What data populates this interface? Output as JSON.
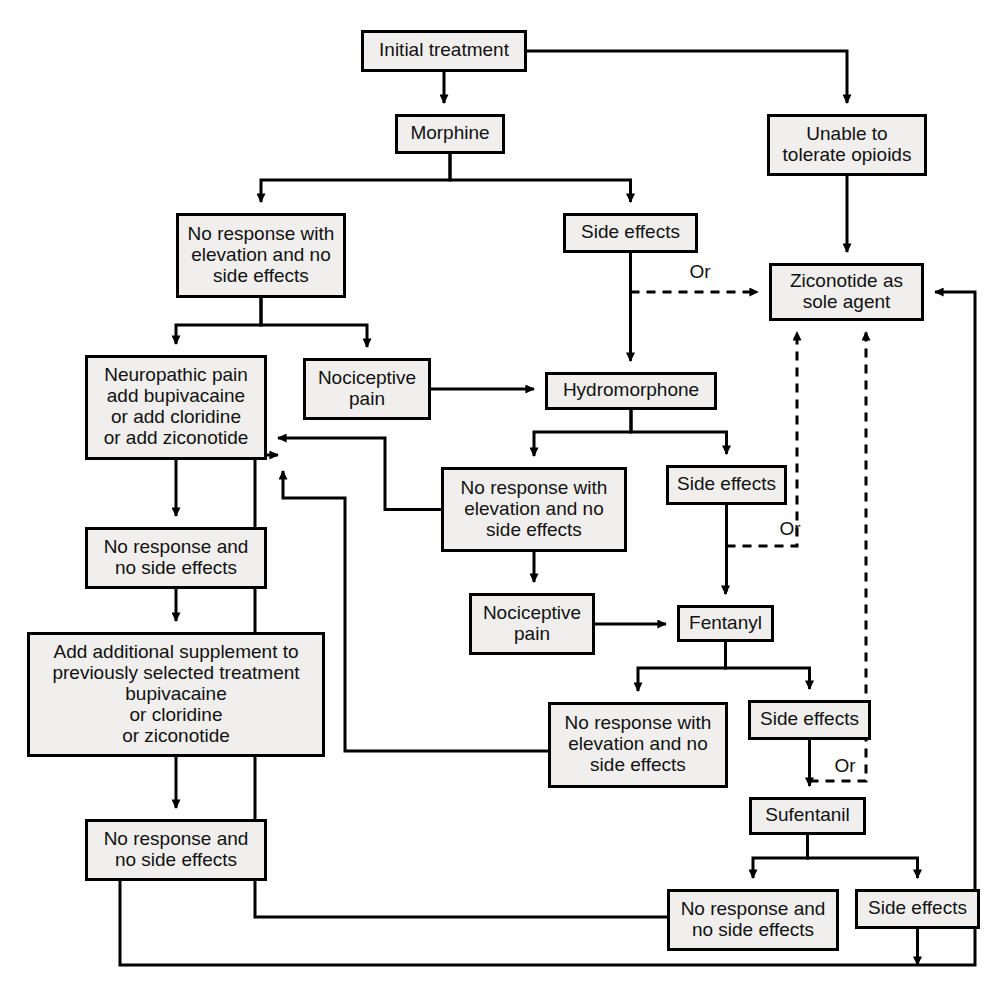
{
  "diagram": {
    "background_color": "#ffffff",
    "node_fill_color": "#f0efed",
    "stroke_color": "#000000",
    "nodes": [
      {
        "id": "initial",
        "label": "Initial treatment",
        "x": 361,
        "y": 30,
        "w": 166,
        "h": 42
      },
      {
        "id": "morphine",
        "label": "Morphine",
        "x": 395,
        "y": 114,
        "w": 110,
        "h": 40
      },
      {
        "id": "unable",
        "label": "Unable to|tolerate opioids",
        "x": 767,
        "y": 114,
        "w": 160,
        "h": 62
      },
      {
        "id": "m_noresp",
        "label": "No response with|elevation and no|side effects",
        "x": 176,
        "y": 213,
        "w": 170,
        "h": 85
      },
      {
        "id": "m_side",
        "label": "Side effects",
        "x": 563,
        "y": 213,
        "w": 135,
        "h": 40
      },
      {
        "id": "zico",
        "label": "Ziconotide as|sole agent",
        "x": 769,
        "y": 263,
        "w": 155,
        "h": 58
      },
      {
        "id": "neuro",
        "label": "Neuropathic pain|add bupivacaine|or add cloridine|or add ziconotide",
        "x": 85,
        "y": 355,
        "w": 182,
        "h": 105
      },
      {
        "id": "m_noci",
        "label": "Nociceptive|pain",
        "x": 303,
        "y": 358,
        "w": 128,
        "h": 62
      },
      {
        "id": "hydro",
        "label": "Hydromorphone",
        "x": 545,
        "y": 372,
        "w": 172,
        "h": 38
      },
      {
        "id": "h_noresp",
        "label": "No response with|elevation and no|side effects",
        "x": 441,
        "y": 467,
        "w": 186,
        "h": 85
      },
      {
        "id": "h_side",
        "label": "Side effects",
        "x": 666,
        "y": 465,
        "w": 121,
        "h": 40
      },
      {
        "id": "n_noresp1",
        "label": "No response and|no side effects",
        "x": 85,
        "y": 527,
        "w": 182,
        "h": 62
      },
      {
        "id": "h_noci",
        "label": "Nociceptive|pain",
        "x": 469,
        "y": 593,
        "w": 126,
        "h": 62
      },
      {
        "id": "fentanyl",
        "label": "Fentanyl",
        "x": 677,
        "y": 605,
        "w": 97,
        "h": 37
      },
      {
        "id": "addsupp",
        "label": "Add additional supplement to|previously selected treatment|bupivacaine|or cloridine|or ziconotide",
        "x": 27,
        "y": 632,
        "w": 298,
        "h": 125
      },
      {
        "id": "f_noresp",
        "label": "No response with|elevation and no|side effects",
        "x": 548,
        "y": 702,
        "w": 180,
        "h": 86
      },
      {
        "id": "f_side",
        "label": "Side effects",
        "x": 748,
        "y": 700,
        "w": 123,
        "h": 40
      },
      {
        "id": "sufentanil",
        "label": "Sufentanil",
        "x": 749,
        "y": 797,
        "w": 117,
        "h": 38
      },
      {
        "id": "n_noresp2",
        "label": "No response and|no side effects",
        "x": 85,
        "y": 819,
        "w": 182,
        "h": 62
      },
      {
        "id": "s_noresp",
        "label": "No response and|no side effects",
        "x": 667,
        "y": 889,
        "w": 172,
        "h": 62
      },
      {
        "id": "s_side",
        "label": "Side effects",
        "x": 855,
        "y": 889,
        "w": 125,
        "h": 40
      }
    ],
    "or_labels": [
      {
        "id": "or-1",
        "text": "Or",
        "x": 700,
        "y": 278
      },
      {
        "id": "or-2",
        "text": "Or",
        "x": 790,
        "y": 535
      },
      {
        "id": "or-3",
        "text": "Or",
        "x": 845,
        "y": 772
      }
    ],
    "edges": [
      {
        "id": "initial-to-morphine",
        "from": "initial",
        "to": "morphine",
        "style": "solid",
        "arrow": true
      },
      {
        "id": "initial-to-unable",
        "from": "initial",
        "to": "unable",
        "style": "solid",
        "arrow": true
      },
      {
        "id": "morphine-to-noresponse",
        "from": "morphine",
        "to": "m_noresp",
        "style": "solid",
        "arrow": true
      },
      {
        "id": "morphine-to-sideeffects",
        "from": "morphine",
        "to": "m_side",
        "style": "solid",
        "arrow": true
      },
      {
        "id": "unable-to-ziconotide",
        "from": "unable",
        "to": "zico",
        "style": "solid",
        "arrow": true
      },
      {
        "id": "msideeffects-to-ziconotide",
        "from": "m_side",
        "to": "zico",
        "style": "dashed",
        "arrow": true
      },
      {
        "id": "msideeffects-to-hydro",
        "from": "m_side",
        "to": "hydro",
        "style": "solid",
        "arrow": true
      },
      {
        "id": "mnoresp-to-neuro",
        "from": "m_noresp",
        "to": "neuro",
        "style": "solid",
        "arrow": true
      },
      {
        "id": "mnoresp-to-noci",
        "from": "m_noresp",
        "to": "m_noci",
        "style": "solid",
        "arrow": true
      },
      {
        "id": "mnoci-to-hydro",
        "from": "m_noci",
        "to": "hydro",
        "style": "solid",
        "arrow": true
      },
      {
        "id": "hydro-to-noresp",
        "from": "hydro",
        "to": "h_noresp",
        "style": "solid",
        "arrow": true
      },
      {
        "id": "hydro-to-sideeffects",
        "from": "hydro",
        "to": "h_side",
        "style": "solid",
        "arrow": true
      },
      {
        "id": "hsideeffects-to-ziconotide",
        "from": "h_side",
        "to": "zico",
        "style": "dashed",
        "arrow": true
      },
      {
        "id": "hsideeffects-to-fentanyl",
        "from": "h_side",
        "to": "fentanyl",
        "style": "solid",
        "arrow": true
      },
      {
        "id": "hnoresp-to-neuro",
        "from": "h_noresp",
        "to": "neuro",
        "style": "solid",
        "arrow": true
      },
      {
        "id": "hnoresp-to-noci",
        "from": "h_noresp",
        "to": "h_noci",
        "style": "solid",
        "arrow": true
      },
      {
        "id": "hnoci-to-fentanyl",
        "from": "h_noci",
        "to": "fentanyl",
        "style": "solid",
        "arrow": true
      },
      {
        "id": "fentanyl-to-noresp",
        "from": "fentanyl",
        "to": "f_noresp",
        "style": "solid",
        "arrow": true
      },
      {
        "id": "fentanyl-to-sideeffects",
        "from": "fentanyl",
        "to": "f_side",
        "style": "solid",
        "arrow": true
      },
      {
        "id": "fsideeffects-to-ziconotide",
        "from": "f_side",
        "to": "zico",
        "style": "dashed",
        "arrow": true
      },
      {
        "id": "fsideeffects-to-sufentanil",
        "from": "f_side",
        "to": "sufentanil",
        "style": "solid",
        "arrow": true
      },
      {
        "id": "fnoresp-to-neuro",
        "from": "f_noresp",
        "to": "neuro",
        "style": "solid",
        "arrow": true
      },
      {
        "id": "neuro-to-noresp1",
        "from": "neuro",
        "to": "n_noresp1",
        "style": "solid",
        "arrow": true
      },
      {
        "id": "noresp1-to-addsupp",
        "from": "n_noresp1",
        "to": "addsupp",
        "style": "solid",
        "arrow": true
      },
      {
        "id": "addsupp-to-noresp2",
        "from": "addsupp",
        "to": "n_noresp2",
        "style": "solid",
        "arrow": true
      },
      {
        "id": "noresp2-to-ziconotide",
        "from": "n_noresp2",
        "to": "zico",
        "style": "solid",
        "arrow": true
      },
      {
        "id": "sufentanil-to-noresp",
        "from": "sufentanil",
        "to": "s_noresp",
        "style": "solid",
        "arrow": true
      },
      {
        "id": "sufentanil-to-sideeffects",
        "from": "sufentanil",
        "to": "s_side",
        "style": "solid",
        "arrow": true
      },
      {
        "id": "snoresp-to-neuro",
        "from": "s_noresp",
        "to": "neuro",
        "style": "solid",
        "arrow": true
      },
      {
        "id": "ssideeffects-to-ziconotide",
        "from": "s_side",
        "to": "zico",
        "style": "solid",
        "arrow": true
      }
    ]
  }
}
